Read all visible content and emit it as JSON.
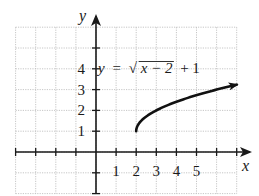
{
  "chart_data": {
    "type": "line",
    "title": "",
    "equation": {
      "lhs": "y",
      "equals": "=",
      "radicand": "x − 2",
      "sqrt_symbol": "√",
      "tail": "+ 1",
      "full": "y = √(x − 2) + 1"
    },
    "xlabel": "x",
    "ylabel": "y",
    "xlim": [
      -4,
      7
    ],
    "ylim": [
      -2,
      6
    ],
    "grid": true,
    "x_tick_labels": [
      "1",
      "2",
      "3",
      "4",
      "5"
    ],
    "y_tick_labels": [
      "1",
      "2",
      "3",
      "4"
    ],
    "series": [
      {
        "name": "y = √(x − 2) + 1",
        "function": "sqrt(x-2)+1",
        "domain": [
          2,
          7
        ],
        "start_point": [
          2,
          1
        ],
        "end_arrow": true,
        "x": [
          2,
          2.25,
          3,
          4,
          5,
          6,
          7
        ],
        "y": [
          1,
          1.5,
          2,
          2.41,
          2.73,
          3,
          3.24
        ]
      }
    ]
  },
  "colors": {
    "grid": "#b8b8b8",
    "axis": "#1a1a1a",
    "curve": "#111111",
    "background": "#ffffff"
  }
}
